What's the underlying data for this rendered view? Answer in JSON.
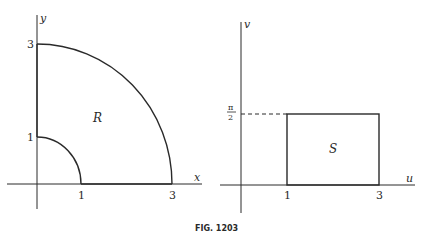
{
  "figure": {
    "caption": "FIG. 1203",
    "left_panel": {
      "x_axis_label": "x",
      "y_axis_label": "y",
      "x_ticks": [
        "1",
        "3"
      ],
      "y_ticks": [
        "1",
        "3"
      ],
      "region_label": "R",
      "description": "Region between quarter circles of radius 1 and 3 in the first quadrant"
    },
    "right_panel": {
      "x_axis_label": "u",
      "y_axis_label": "v",
      "u_ticks": [
        "1",
        "3"
      ],
      "v_tick_numerator": "π",
      "v_tick_denominator": "2",
      "region_label": "S",
      "description": "Rectangle 1 ≤ u ≤ 3, 0 ≤ v ≤ π/2"
    }
  }
}
